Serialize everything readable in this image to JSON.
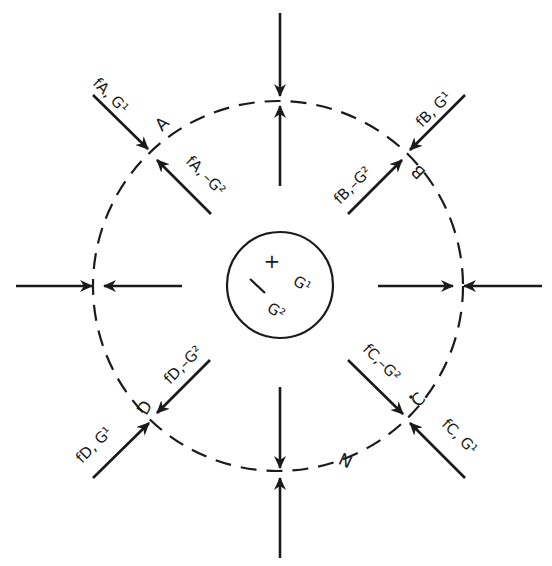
{
  "diagram": {
    "colors": {
      "ink": "#1a1a1a",
      "background": "#ffffff"
    },
    "outer_circle": {
      "style": "dashed",
      "cx": 278,
      "cy": 286,
      "r": 184
    },
    "inner_circle": {
      "style": "solid",
      "cx": 280,
      "cy": 285,
      "r": 53
    },
    "center_labels": {
      "plus": "+",
      "plus_label": "G¹",
      "minus": "—",
      "minus_label": "G²"
    },
    "points": {
      "A": "A",
      "B": "B",
      "C": "C",
      "D": "D",
      "N": "N"
    },
    "force_labels": {
      "fA_G1": "fA, G¹",
      "fA_mG2": "fA, –G²",
      "fB_G1": "fB, G¹",
      "fB_mG2": "fB,–G²",
      "fC_mG2": "fC,–G²",
      "fC_G1": "fC, G¹",
      "fD_mG2": "fD,–G²",
      "fD_G1": "fD, G¹"
    }
  }
}
